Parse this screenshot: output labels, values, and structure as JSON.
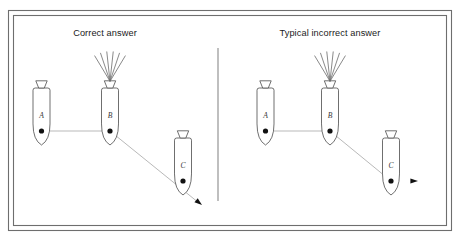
{
  "figure": {
    "caption_alt": "Two side-by-side schematic panels comparing a correct and a typical incorrect answer for a three-vessel relative-motion problem",
    "background_color": "#ffffff",
    "line_color": "#555555",
    "track_color": "#b9b9b9",
    "label_color": "#1a1a1a",
    "frame": {
      "outer": {
        "x": 8,
        "y": 10,
        "width": 443,
        "height": 220
      },
      "inner": {
        "x": 13,
        "y": 15,
        "width": 433,
        "height": 210
      }
    },
    "divider": {
      "x": 218,
      "y1": 48,
      "y2": 201
    }
  },
  "panels": [
    {
      "id": "correct",
      "title": "Correct answer",
      "title_x": 105,
      "title_y": 36,
      "ships": [
        {
          "id": "A",
          "label": "A",
          "label_x": 41.5,
          "label_y": 118,
          "hull_x": 33,
          "hull_y": 88,
          "hull_w": 17,
          "hull_h": 57,
          "dot_x": 41.5,
          "dot_y": 131,
          "has_rays": false
        },
        {
          "id": "B",
          "label": "B",
          "label_x": 110,
          "label_y": 118,
          "hull_x": 101.5,
          "hull_y": 88,
          "hull_w": 17,
          "hull_h": 57,
          "dot_x": 110,
          "dot_y": 131,
          "has_rays": true
        },
        {
          "id": "C",
          "label": "C",
          "label_x": 183,
          "label_y": 168,
          "hull_x": 174.5,
          "hull_y": 138,
          "hull_w": 17,
          "hull_h": 57,
          "dot_x": 183,
          "dot_y": 181,
          "has_rays": false
        }
      ],
      "track": {
        "points": "41.5,131 110,131 199,203",
        "arrow_x": 202,
        "arrow_y": 205,
        "arrow_angle": 39,
        "direction": "down-right along the B-to-C bearing line"
      }
    },
    {
      "id": "incorrect",
      "title": "Typical incorrect answer",
      "title_x": 330,
      "title_y": 36,
      "ships": [
        {
          "id": "A",
          "label": "A",
          "label_x": 265.5,
          "label_y": 118,
          "hull_x": 257,
          "hull_y": 88,
          "hull_w": 17,
          "hull_h": 57,
          "dot_x": 265.5,
          "dot_y": 131,
          "has_rays": false
        },
        {
          "id": "B",
          "label": "B",
          "label_x": 330,
          "label_y": 118,
          "hull_x": 321.5,
          "hull_y": 88,
          "hull_w": 17,
          "hull_h": 57,
          "dot_x": 330,
          "dot_y": 131,
          "has_rays": true
        },
        {
          "id": "C",
          "label": "C",
          "label_x": 391,
          "label_y": 168,
          "hull_x": 382.5,
          "hull_y": 138,
          "hull_w": 17,
          "hull_h": 57,
          "dot_x": 391,
          "dot_y": 181,
          "has_rays": false
        }
      ],
      "track": {
        "points": "265.5,131 330,131 391,181",
        "arrow_x": 418,
        "arrow_y": 181,
        "arrow_angle": 0,
        "direction": "horizontal to the right from vessel C"
      }
    }
  ],
  "ship_glyph": {
    "rays_count": 6,
    "funnel_label": "funnel",
    "dot_label": "position marker"
  }
}
